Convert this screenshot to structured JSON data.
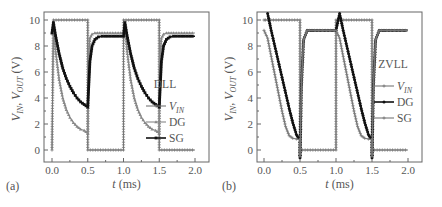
{
  "chart_data": [
    {
      "type": "line",
      "panel_label": "(a)",
      "legend_title": "DLL",
      "xlabel": "t (ms)",
      "ylabel": "V_IN, V_OUT (V)",
      "xlim": [
        -0.1,
        2.2
      ],
      "ylim": [
        -1,
        10.5
      ],
      "xticks": [
        "0.0",
        "0.5",
        "1.0",
        "1.5",
        "2.0"
      ],
      "yticks": [
        "0",
        "2",
        "4",
        "6",
        "8",
        "10"
      ],
      "grid": false,
      "legend_position": "right-middle",
      "series": [
        {
          "name": "V_IN",
          "color": "#777777",
          "marker": "plus",
          "x": [
            0.0,
            0.02,
            0.5,
            0.5,
            1.0,
            1.0,
            1.5,
            1.5,
            2.0
          ],
          "y": [
            0,
            10,
            10,
            0,
            0,
            10,
            10,
            0,
            0
          ]
        },
        {
          "name": "DG",
          "color": "#888888",
          "marker": "triangle",
          "x": [
            0.0,
            0.02,
            0.05,
            0.1,
            0.15,
            0.2,
            0.25,
            0.3,
            0.35,
            0.4,
            0.45,
            0.5,
            0.51,
            0.53,
            0.56,
            0.6,
            0.7,
            1.0,
            1.02,
            1.05,
            1.1,
            1.15,
            1.2,
            1.25,
            1.3,
            1.35,
            1.4,
            1.45,
            1.5,
            1.51,
            1.53,
            1.56,
            1.6,
            1.7,
            2.0
          ],
          "y": [
            9.0,
            9.5,
            7.6,
            5.4,
            4.0,
            3.1,
            2.5,
            2.1,
            1.8,
            1.6,
            1.5,
            1.3,
            7.0,
            8.6,
            8.9,
            9.0,
            9.0,
            9.0,
            9.5,
            7.6,
            5.4,
            4.0,
            3.1,
            2.5,
            2.1,
            1.8,
            1.6,
            1.5,
            1.3,
            7.0,
            8.6,
            8.9,
            9.0,
            9.0,
            9.0
          ]
        },
        {
          "name": "SG",
          "color": "#111111",
          "marker": "square",
          "x": [
            0.0,
            0.02,
            0.05,
            0.1,
            0.15,
            0.2,
            0.25,
            0.3,
            0.35,
            0.4,
            0.45,
            0.5,
            0.51,
            0.53,
            0.56,
            0.6,
            0.65,
            0.7,
            1.0,
            1.02,
            1.05,
            1.1,
            1.15,
            1.2,
            1.25,
            1.3,
            1.35,
            1.4,
            1.45,
            1.5,
            1.51,
            1.53,
            1.56,
            1.6,
            1.65,
            1.7,
            2.0
          ],
          "y": [
            9.0,
            9.8,
            8.8,
            7.4,
            6.3,
            5.5,
            4.9,
            4.4,
            4.0,
            3.7,
            3.5,
            3.3,
            4.5,
            6.8,
            8.0,
            8.5,
            8.7,
            8.75,
            8.75,
            9.8,
            8.8,
            7.4,
            6.3,
            5.5,
            4.9,
            4.4,
            4.0,
            3.7,
            3.5,
            3.3,
            4.5,
            6.8,
            8.0,
            8.5,
            8.7,
            8.75,
            8.75
          ]
        }
      ]
    },
    {
      "type": "line",
      "panel_label": "(b)",
      "legend_title": "ZVLL",
      "xlabel": "t (ms)",
      "ylabel": "V_IN, V_OUT (V)",
      "xlim": [
        -0.1,
        2.2
      ],
      "ylim": [
        -1,
        10.5
      ],
      "xticks": [
        "0.0",
        "0.5",
        "1.0",
        "1.5",
        "2.0"
      ],
      "yticks": [
        "0",
        "2",
        "4",
        "6",
        "8",
        "10"
      ],
      "grid": false,
      "legend_position": "right-middle",
      "series": [
        {
          "name": "V_IN",
          "color": "#777777",
          "marker": "plus",
          "x": [
            0.0,
            0.02,
            0.5,
            0.5,
            1.0,
            1.0,
            1.5,
            1.5,
            2.0
          ],
          "y": [
            10,
            10,
            10,
            0,
            0,
            10,
            10,
            0,
            0
          ]
        },
        {
          "name": "DG",
          "color": "#111111",
          "marker": "circle",
          "x": [
            0.05,
            0.1,
            0.15,
            0.2,
            0.25,
            0.3,
            0.35,
            0.4,
            0.45,
            0.48,
            0.5,
            0.5,
            0.52,
            0.55,
            0.6,
            0.7,
            1.0,
            1.05,
            1.1,
            1.15,
            1.2,
            1.25,
            1.3,
            1.35,
            1.4,
            1.45,
            1.48,
            1.5,
            1.5,
            1.52,
            1.55,
            1.6,
            1.7,
            2.0
          ],
          "y": [
            10.5,
            9.2,
            8.0,
            6.8,
            5.6,
            4.4,
            3.2,
            2.1,
            1.2,
            0.9,
            0.8,
            -0.6,
            5.0,
            8.5,
            9.2,
            9.2,
            9.2,
            10.5,
            9.2,
            8.0,
            6.8,
            5.6,
            4.4,
            3.2,
            2.1,
            1.2,
            0.9,
            0.8,
            -0.6,
            5.0,
            8.5,
            9.2,
            9.2,
            9.2
          ]
        },
        {
          "name": "SG",
          "color": "#777777",
          "marker": "plus",
          "x": [
            0.0,
            0.05,
            0.1,
            0.15,
            0.2,
            0.25,
            0.3,
            0.35,
            0.4,
            0.45,
            0.5,
            0.5,
            0.52,
            0.55,
            0.6,
            0.7,
            1.0,
            1.05,
            1.1,
            1.15,
            1.2,
            1.25,
            1.3,
            1.35,
            1.4,
            1.45,
            1.5,
            1.5,
            1.52,
            1.55,
            1.6,
            1.7,
            2.0
          ],
          "y": [
            9.2,
            8.6,
            7.2,
            5.8,
            4.4,
            3.0,
            1.8,
            1.1,
            0.9,
            0.85,
            0.8,
            -0.5,
            5.0,
            8.5,
            9.2,
            9.2,
            9.2,
            8.6,
            7.2,
            5.8,
            4.4,
            3.0,
            1.8,
            1.1,
            0.9,
            0.85,
            0.8,
            -0.5,
            5.0,
            8.5,
            9.2,
            9.2,
            9.2
          ]
        }
      ]
    }
  ],
  "panels": [
    {
      "label": "(a)",
      "legend_title": "DLL",
      "legend": [
        "V",
        "IN",
        "DG",
        "SG"
      ],
      "xlabel_italic": "t",
      "xlabel_unit": " (ms)"
    },
    {
      "label": "(b)",
      "legend_title": "ZVLL",
      "legend": [
        "V",
        "IN",
        "DG",
        "SG"
      ],
      "xlabel_italic": "t",
      "xlabel_unit": " (ms)"
    }
  ]
}
